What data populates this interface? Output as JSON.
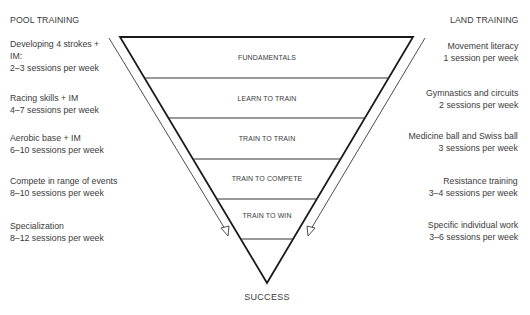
{
  "pool_training": {
    "title": "POOL TRAINING",
    "items": [
      {
        "lines": [
          "Developing 4 strokes +",
          "IM:",
          "2–3 sessions per week"
        ]
      },
      {
        "lines": [
          "Racing skills + IM",
          "4–7 sessions per week"
        ]
      },
      {
        "lines": [
          "Aerobic base + IM",
          "6–10 sessions per week"
        ]
      },
      {
        "lines": [
          "Compete in range of events",
          "8–10 sessions per week"
        ]
      },
      {
        "lines": [
          "Specialization",
          "8–12 sessions per week"
        ]
      }
    ]
  },
  "land_training": {
    "title": "LAND TRAINING",
    "items": [
      {
        "lines": [
          "Movement literacy",
          "1 session per week"
        ]
      },
      {
        "lines": [
          "Gymnastics and circuits",
          "2 sessions per week"
        ]
      },
      {
        "lines": [
          "Medicine ball and Swiss ball",
          "3 sessions per week"
        ]
      },
      {
        "lines": [
          "Resistance training",
          "3–4 sessions per week"
        ]
      },
      {
        "lines": [
          "Specific individual work",
          "3–6 sessions per week"
        ]
      }
    ]
  },
  "funnel": {
    "stages": [
      "FUNDAMENTALS",
      "LEARN TO TRAIN",
      "TRAIN TO TRAIN",
      "TRAIN TO COMPETE",
      "TRAIN TO WIN"
    ],
    "outcome": "SUCCESS",
    "stroke_color": "#1a1a1a",
    "arrow_color": "#3a3a3a"
  }
}
